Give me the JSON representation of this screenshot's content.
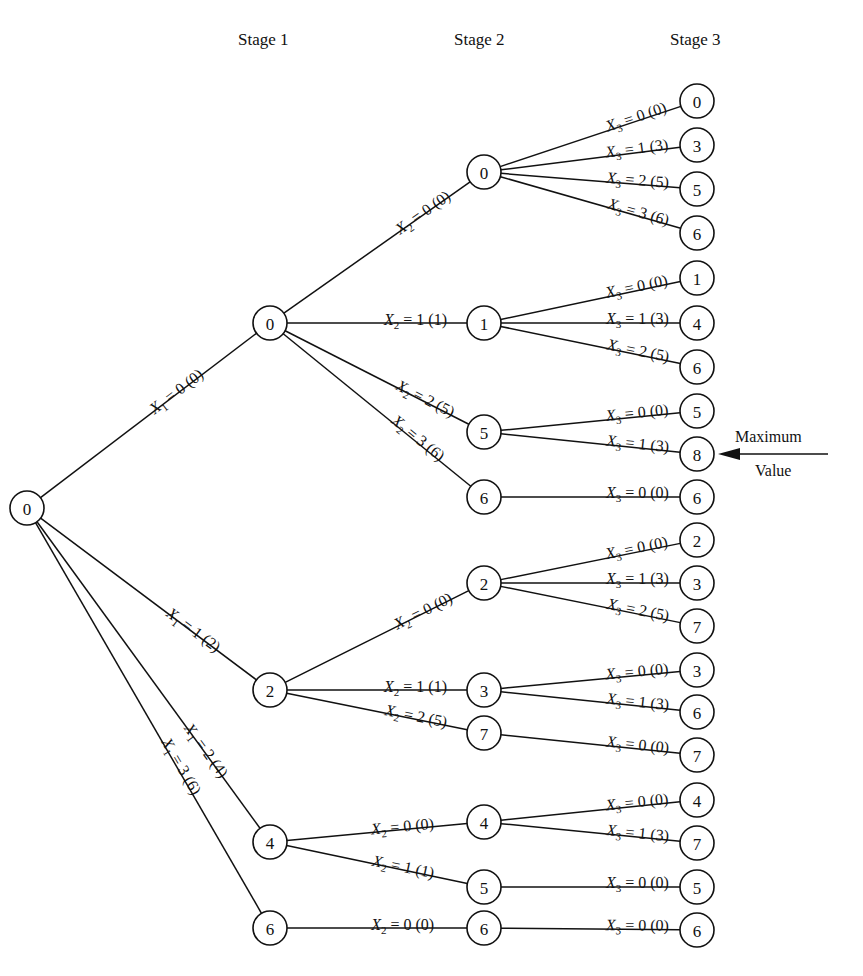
{
  "headers": {
    "stage1": "Stage 1",
    "stage2": "Stage 2",
    "stage3": "Stage 3"
  },
  "annotation": {
    "line1": "Maximum",
    "line2": "Value",
    "points_to": "s3_8"
  },
  "style": {
    "ink": "#111111",
    "background": "#ffffff"
  },
  "nodes": [
    {
      "id": "root",
      "value": "0",
      "x": 27,
      "y": 508
    },
    {
      "id": "s1_0",
      "value": "0",
      "x": 270,
      "y": 323
    },
    {
      "id": "s1_2",
      "value": "2",
      "x": 270,
      "y": 690
    },
    {
      "id": "s1_4",
      "value": "4",
      "x": 270,
      "y": 842
    },
    {
      "id": "s1_6",
      "value": "6",
      "x": 270,
      "y": 928
    },
    {
      "id": "s2_0a",
      "value": "0",
      "x": 484,
      "y": 172
    },
    {
      "id": "s2_1a",
      "value": "1",
      "x": 484,
      "y": 323
    },
    {
      "id": "s2_5a",
      "value": "5",
      "x": 484,
      "y": 432
    },
    {
      "id": "s2_6a",
      "value": "6",
      "x": 484,
      "y": 497
    },
    {
      "id": "s2_2b",
      "value": "2",
      "x": 484,
      "y": 583
    },
    {
      "id": "s2_3b",
      "value": "3",
      "x": 484,
      "y": 690
    },
    {
      "id": "s2_7b",
      "value": "7",
      "x": 484,
      "y": 733
    },
    {
      "id": "s2_4c",
      "value": "4",
      "x": 484,
      "y": 822
    },
    {
      "id": "s2_5c",
      "value": "5",
      "x": 484,
      "y": 887
    },
    {
      "id": "s2_6d",
      "value": "6",
      "x": 484,
      "y": 928
    },
    {
      "id": "s3_0",
      "value": "0",
      "x": 697,
      "y": 101
    },
    {
      "id": "s3_3",
      "value": "3",
      "x": 697,
      "y": 145
    },
    {
      "id": "s3_5",
      "value": "5",
      "x": 697,
      "y": 189
    },
    {
      "id": "s3_6",
      "value": "6",
      "x": 697,
      "y": 233
    },
    {
      "id": "s3_1",
      "value": "1",
      "x": 697,
      "y": 278
    },
    {
      "id": "s3_4",
      "value": "4",
      "x": 697,
      "y": 323
    },
    {
      "id": "s3_6b",
      "value": "6",
      "x": 697,
      "y": 367
    },
    {
      "id": "s3_5b",
      "value": "5",
      "x": 697,
      "y": 411
    },
    {
      "id": "s3_8",
      "value": "8",
      "x": 697,
      "y": 454
    },
    {
      "id": "s3_6c",
      "value": "6",
      "x": 697,
      "y": 497
    },
    {
      "id": "s3_2",
      "value": "2",
      "x": 697,
      "y": 540
    },
    {
      "id": "s3_3b",
      "value": "3",
      "x": 697,
      "y": 583
    },
    {
      "id": "s3_7",
      "value": "7",
      "x": 697,
      "y": 626
    },
    {
      "id": "s3_3c",
      "value": "3",
      "x": 697,
      "y": 670
    },
    {
      "id": "s3_6d",
      "value": "6",
      "x": 697,
      "y": 712
    },
    {
      "id": "s3_7b",
      "value": "7",
      "x": 697,
      "y": 755
    },
    {
      "id": "s3_4b",
      "value": "4",
      "x": 697,
      "y": 800
    },
    {
      "id": "s3_7c",
      "value": "7",
      "x": 697,
      "y": 843
    },
    {
      "id": "s3_5c",
      "value": "5",
      "x": 697,
      "y": 887
    },
    {
      "id": "s3_6e",
      "value": "6",
      "x": 697,
      "y": 930
    }
  ],
  "edges": [
    {
      "from": "root",
      "to": "s1_0",
      "var": "X",
      "sub": "1",
      "eq": " = 0 (0)",
      "lx": 0.62,
      "off": -8
    },
    {
      "from": "root",
      "to": "s1_2",
      "var": "X",
      "sub": "1",
      "eq": " = 1 (2)",
      "lx": 0.68,
      "off": -8
    },
    {
      "from": "root",
      "to": "s1_4",
      "var": "X",
      "sub": "1",
      "eq": " = 2 (4)",
      "lx": 0.73,
      "off": -8
    },
    {
      "from": "root",
      "to": "s1_6",
      "var": "X",
      "sub": "1",
      "eq": " = 3 (6)",
      "lx": 0.62,
      "off": -6
    },
    {
      "from": "s1_0",
      "to": "s2_0a",
      "var": "X",
      "sub": "2",
      "eq": " = 0 (0)",
      "lx": 0.72,
      "off": -8
    },
    {
      "from": "s1_0",
      "to": "s2_1a",
      "var": "X",
      "sub": "2",
      "eq": " = 1 (1)",
      "lx": 0.68,
      "off": -7
    },
    {
      "from": "s1_0",
      "to": "s2_5a",
      "var": "X",
      "sub": "2",
      "eq": " = 2 (5)",
      "lx": 0.72,
      "off": -7
    },
    {
      "from": "s1_0",
      "to": "s2_6a",
      "var": "X",
      "sub": "2",
      "eq": " = 3 (6)",
      "lx": 0.68,
      "off": -6
    },
    {
      "from": "s1_2",
      "to": "s2_2b",
      "var": "X",
      "sub": "2",
      "eq": " = 0 (0)",
      "lx": 0.72,
      "off": -8
    },
    {
      "from": "s1_2",
      "to": "s2_3b",
      "var": "X",
      "sub": "2",
      "eq": " = 1 (1)",
      "lx": 0.68,
      "off": -7
    },
    {
      "from": "s1_2",
      "to": "s2_7b",
      "var": "X",
      "sub": "2",
      "eq": " = 2 (5)",
      "lx": 0.68,
      "off": -7
    },
    {
      "from": "s1_4",
      "to": "s2_4c",
      "var": "X",
      "sub": "2",
      "eq": " = 0 (0)",
      "lx": 0.62,
      "off": -7
    },
    {
      "from": "s1_4",
      "to": "s2_5c",
      "var": "X",
      "sub": "2",
      "eq": " = 1 (1)",
      "lx": 0.62,
      "off": -7
    },
    {
      "from": "s1_6",
      "to": "s2_6d",
      "var": "X",
      "sub": "2",
      "eq": " = 0 (0)",
      "lx": 0.62,
      "off": -7
    },
    {
      "from": "s2_0a",
      "to": "s3_0",
      "var": "X",
      "sub": "3",
      "eq": " = 0 (0)",
      "lx": 0.72,
      "off": -6
    },
    {
      "from": "s2_0a",
      "to": "s3_3",
      "var": "X",
      "sub": "3",
      "eq": " = 1 (3)",
      "lx": 0.72,
      "off": -6
    },
    {
      "from": "s2_0a",
      "to": "s3_5",
      "var": "X",
      "sub": "3",
      "eq": " = 2 (5)",
      "lx": 0.72,
      "off": -6
    },
    {
      "from": "s2_0a",
      "to": "s3_6",
      "var": "X",
      "sub": "3",
      "eq": " = 3 (6)",
      "lx": 0.72,
      "off": -6
    },
    {
      "from": "s2_1a",
      "to": "s3_1",
      "var": "X",
      "sub": "3",
      "eq": " = 0 (0)",
      "lx": 0.72,
      "off": -6
    },
    {
      "from": "s2_1a",
      "to": "s3_4",
      "var": "X",
      "sub": "3",
      "eq": " = 1 (3)",
      "lx": 0.72,
      "off": -6
    },
    {
      "from": "s2_1a",
      "to": "s3_6b",
      "var": "X",
      "sub": "3",
      "eq": " = 2 (5)",
      "lx": 0.72,
      "off": -6
    },
    {
      "from": "s2_5a",
      "to": "s3_5b",
      "var": "X",
      "sub": "3",
      "eq": " = 0 (0)",
      "lx": 0.72,
      "off": -6
    },
    {
      "from": "s2_5a",
      "to": "s3_8",
      "var": "X",
      "sub": "3",
      "eq": " = 1 (3)",
      "lx": 0.72,
      "off": -6
    },
    {
      "from": "s2_6a",
      "to": "s3_6c",
      "var": "X",
      "sub": "3",
      "eq": " = 0 (0)",
      "lx": 0.72,
      "off": -6
    },
    {
      "from": "s2_2b",
      "to": "s3_2",
      "var": "X",
      "sub": "3",
      "eq": " = 0 (0)",
      "lx": 0.72,
      "off": -6
    },
    {
      "from": "s2_2b",
      "to": "s3_3b",
      "var": "X",
      "sub": "3",
      "eq": " = 1 (3)",
      "lx": 0.72,
      "off": -6
    },
    {
      "from": "s2_2b",
      "to": "s3_7",
      "var": "X",
      "sub": "3",
      "eq": " = 2 (5)",
      "lx": 0.72,
      "off": -6
    },
    {
      "from": "s2_3b",
      "to": "s3_3c",
      "var": "X",
      "sub": "3",
      "eq": " = 0 (0)",
      "lx": 0.72,
      "off": -6
    },
    {
      "from": "s2_3b",
      "to": "s3_6d",
      "var": "X",
      "sub": "3",
      "eq": " = 1 (3)",
      "lx": 0.72,
      "off": -6
    },
    {
      "from": "s2_7b",
      "to": "s3_7b",
      "var": "X",
      "sub": "3",
      "eq": " = 0 (0)",
      "lx": 0.72,
      "off": -6
    },
    {
      "from": "s2_4c",
      "to": "s3_4b",
      "var": "X",
      "sub": "3",
      "eq": " = 0 (0)",
      "lx": 0.72,
      "off": -6
    },
    {
      "from": "s2_4c",
      "to": "s3_7c",
      "var": "X",
      "sub": "3",
      "eq": " = 1 (3)",
      "lx": 0.72,
      "off": -6
    },
    {
      "from": "s2_5c",
      "to": "s3_5c",
      "var": "X",
      "sub": "3",
      "eq": " = 0 (0)",
      "lx": 0.72,
      "off": -6
    },
    {
      "from": "s2_6d",
      "to": "s3_6e",
      "var": "X",
      "sub": "3",
      "eq": " = 0 (0)",
      "lx": 0.72,
      "off": -6
    }
  ]
}
